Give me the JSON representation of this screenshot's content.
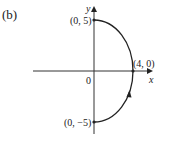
{
  "figure": {
    "panel_label": "(b)",
    "axes": {
      "x_label": "x",
      "y_label": "y",
      "origin_label": "0"
    },
    "points": [
      {
        "label": "(0, 5)",
        "x": 0,
        "y": 5
      },
      {
        "label": "(4, 0)",
        "x": 4,
        "y": 0
      },
      {
        "label": "(0, −5)",
        "x": 0,
        "y": -5
      }
    ],
    "curve": {
      "description": "right half of ellipse x^2/16 + y^2/25 = 1, from (0,-5) to (0,5)",
      "direction": "counterclockwise (arrow pointing upward on lower-right part)",
      "color": "#222222"
    }
  }
}
